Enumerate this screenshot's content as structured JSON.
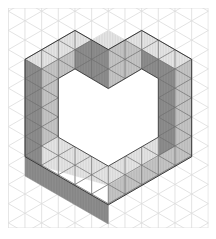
{
  "figure": {
    "title": "",
    "grid": {
      "x0": 8.3,
      "y0": 8,
      "x1": 208.3,
      "y1": 228,
      "col_spacing": 16.667,
      "line_color": "#dcdcdc"
    },
    "colors": {
      "top": "#e6e6e6",
      "right": "#c6c6c6",
      "left": "#8e8e8e",
      "edge": "#3a3a3a",
      "face_grid": "#6e6e6e"
    },
    "faces": [
      {
        "name": "top-left-arm-top",
        "shade": "top",
        "pts": [
          [
            25,
            59.3
          ],
          [
            75,
            30.4
          ],
          [
            91.7,
            40
          ],
          [
            41.7,
            68.9
          ]
        ]
      },
      {
        "name": "top-right-arm-top",
        "shade": "top",
        "pts": [
          [
            125,
            40
          ],
          [
            141.7,
            30.4
          ],
          [
            191.7,
            59.3
          ],
          [
            175,
            68.9
          ]
        ]
      },
      {
        "name": "top-left-arm-under-right",
        "shade": "right",
        "pts": [
          [
            41.7,
            68.9
          ],
          [
            91.7,
            40
          ],
          [
            91.7,
            59.3
          ],
          [
            58.3,
            78.5
          ],
          [
            58.3,
            78.5
          ]
        ]
      },
      {
        "name": "top-left-arm-under-right-2",
        "shade": "right",
        "pts": [
          [
            41.7,
            68.9
          ],
          [
            75,
            49.6
          ],
          [
            75,
            68.9
          ],
          [
            58.3,
            78.5
          ]
        ]
      },
      {
        "name": "center-dark",
        "shade": "left",
        "pts": [
          [
            75,
            49.6
          ],
          [
            91.7,
            40
          ],
          [
            108.3,
            49.6
          ],
          [
            108.3,
            88.6
          ],
          [
            75,
            68.9
          ]
        ]
      },
      {
        "name": "center-top-right",
        "shade": "top",
        "pts": [
          [
            91.7,
            40
          ],
          [
            108.3,
            30.4
          ],
          [
            125,
            40
          ],
          [
            108.3,
            49.6
          ]
        ]
      },
      {
        "name": "center-right-face",
        "shade": "right",
        "pts": [
          [
            108.3,
            49.6
          ],
          [
            125,
            40
          ],
          [
            141.7,
            49.6
          ],
          [
            141.7,
            68.9
          ],
          [
            108.3,
            88.6
          ]
        ]
      },
      {
        "name": "right-inner-dark",
        "shade": "left",
        "pts": [
          [
            141.7,
            49.6
          ],
          [
            158.3,
            59.3
          ],
          [
            175,
            68.9
          ],
          [
            175,
            166.3
          ],
          [
            158.3,
            156.7
          ],
          [
            158.3,
            78.5
          ],
          [
            141.7,
            68.9
          ]
        ]
      },
      {
        "name": "right-outer-face",
        "shade": "right",
        "pts": [
          [
            175,
            68.9
          ],
          [
            191.7,
            59.3
          ],
          [
            191.7,
            156.7
          ],
          [
            175,
            166.3
          ]
        ]
      },
      {
        "name": "left-outer-dark",
        "shade": "left",
        "pts": [
          [
            25,
            59.3
          ],
          [
            41.7,
            68.9
          ],
          [
            41.7,
            166.3
          ],
          [
            25,
            156.7
          ]
        ]
      },
      {
        "name": "left-inner-right",
        "shade": "right",
        "pts": [
          [
            41.7,
            68.9
          ],
          [
            58.3,
            78.5
          ],
          [
            58.3,
            137.2
          ],
          [
            41.7,
            146.8
          ]
        ]
      },
      {
        "name": "bottom-arm-top",
        "shade": "top",
        "pts": [
          [
            41.7,
            146.8
          ],
          [
            58.3,
            137.2
          ],
          [
            108.3,
            166.1
          ],
          [
            158.3,
            137.2
          ],
          [
            158.3,
            156.7
          ],
          [
            175,
            166.3
          ],
          [
            108.3,
            204.8
          ],
          [
            108.3,
            185.5
          ],
          [
            41.7,
            166.3
          ]
        ]
      },
      {
        "name": "bottom-arm-left-dark",
        "shade": "left",
        "pts": [
          [
            25,
            156.7
          ],
          [
            41.7,
            166.3
          ],
          [
            108.3,
            204.8
          ],
          [
            108.3,
            224
          ],
          [
            25,
            176
          ]
        ]
      },
      {
        "name": "bottom-arm-right",
        "shade": "right",
        "pts": [
          [
            108.3,
            185.5
          ],
          [
            175,
            146.8
          ],
          [
            175,
            166.3
          ],
          [
            108.3,
            204.8
          ]
        ]
      }
    ],
    "outline": [
      [
        25,
        59.3
      ],
      [
        75,
        30.4
      ],
      [
        108.3,
        49.6
      ],
      [
        141.7,
        30.4
      ],
      [
        191.7,
        59.3
      ],
      [
        191.7,
        156.7
      ],
      [
        108.3,
        204.8
      ],
      [
        25,
        156.7
      ]
    ]
  }
}
